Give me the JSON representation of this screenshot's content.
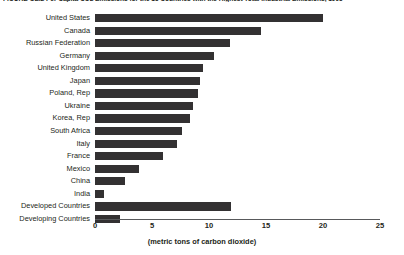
{
  "chart_data": {
    "type": "bar",
    "orientation": "horizontal",
    "title": "FIGURE GE.2  Per Capita CO2 Emissions for the 15 Countries with the Highest Total Industrial Emissions, 1995",
    "xlabel": "(metric tons of carbon dioxide)",
    "ylabel": "",
    "xlim": [
      0,
      25
    ],
    "xticks": [
      0,
      5,
      10,
      15,
      20,
      25
    ],
    "xtick_labels": [
      "0",
      "5",
      "10",
      "15",
      "20",
      "25"
    ],
    "grid": false,
    "legend": null,
    "bar_color": "#333132",
    "axis_color": "#58595b",
    "categories": [
      "United States",
      "Canada",
      "Russian Federation",
      "Germany",
      "United Kingdom",
      "Japan",
      "Poland, Rep",
      "Ukraine",
      "Korea, Rep",
      "South Africa",
      "Italy",
      "France",
      "Mexico",
      "China",
      "India",
      "Developed Countries",
      "Developing Countries"
    ],
    "values": [
      20.0,
      14.6,
      11.8,
      10.4,
      9.5,
      9.2,
      9.0,
      8.6,
      8.3,
      7.6,
      7.2,
      6.0,
      3.9,
      2.6,
      0.8,
      11.9,
      2.2
    ]
  }
}
